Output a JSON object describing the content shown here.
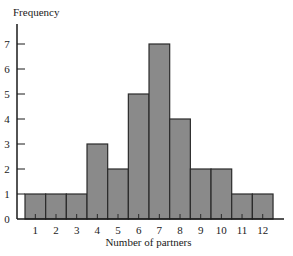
{
  "chart_data": {
    "type": "bar",
    "title": "",
    "xlabel": "Number of partners",
    "ylabel": "Frequency",
    "categories": [
      "1",
      "2",
      "3",
      "4",
      "5",
      "6",
      "7",
      "8",
      "9",
      "10",
      "11",
      "12"
    ],
    "values": [
      1,
      1,
      1,
      3,
      2,
      5,
      7,
      4,
      2,
      2,
      1,
      1
    ],
    "yticks": [
      "0",
      "1",
      "2",
      "3",
      "4",
      "5",
      "6",
      "7"
    ],
    "ylim": [
      0,
      7.8
    ],
    "grid": false,
    "legend": null,
    "bar_color": "#8a8a8a",
    "bar_edge_color": "#2a2a2a"
  }
}
